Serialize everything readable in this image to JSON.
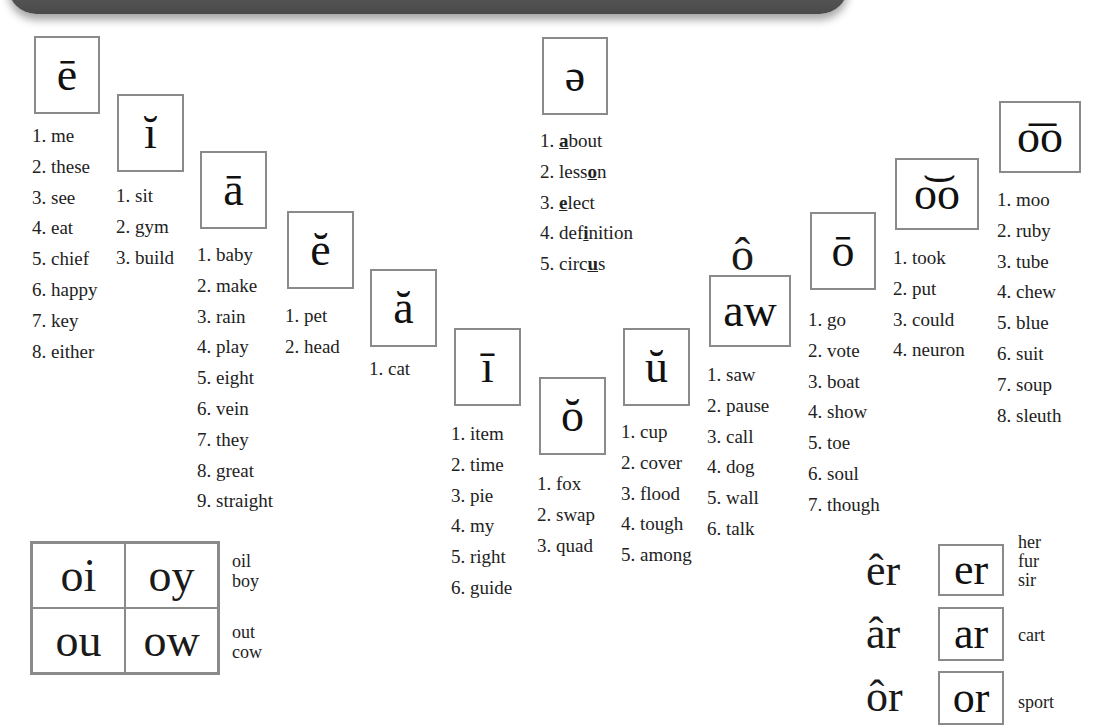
{
  "banner": {
    "visible": true,
    "color": "#555555"
  },
  "vowels": [
    {
      "id": "e-long",
      "symbol": "ē",
      "words": [
        "1. me",
        "2. these",
        "3. see",
        "4. eat",
        "5. chief",
        "6. happy",
        "7. key",
        "8. either"
      ]
    },
    {
      "id": "i-short",
      "symbol": "ĭ",
      "words": [
        "1. sit",
        "2. gym",
        "3. build"
      ]
    },
    {
      "id": "a-long",
      "symbol": "ā",
      "words": [
        "1. baby",
        "2. make",
        "3. rain",
        "4. play",
        "5. eight",
        "6. vein",
        "7. they",
        "8. great",
        "9. straight"
      ]
    },
    {
      "id": "e-short",
      "symbol": "ĕ",
      "words": [
        "1. pet",
        "2. head"
      ]
    },
    {
      "id": "a-short",
      "symbol": "ă",
      "words": [
        "1. cat"
      ]
    },
    {
      "id": "schwa",
      "symbol": "ə",
      "words": [
        {
          "pre": "1. ",
          "u": "a",
          "post": "bout"
        },
        {
          "pre": "2. less",
          "u": "o",
          "post": "n"
        },
        {
          "pre": "3. ",
          "u": "e",
          "post": "lect"
        },
        {
          "pre": "4. def",
          "u": "i",
          "post": "nition"
        },
        {
          "pre": "5. circ",
          "u": "u",
          "post": "s"
        }
      ]
    },
    {
      "id": "i-long",
      "symbol": "ī",
      "words": [
        "1. item",
        "2. time",
        "3. pie",
        "4. my",
        "5. right",
        "6. guide"
      ]
    },
    {
      "id": "o-short",
      "symbol": "ŏ",
      "words": [
        "1. fox",
        "2. swap",
        "3. quad"
      ]
    },
    {
      "id": "u-short",
      "symbol": "ŭ",
      "words": [
        "1. cup",
        "2. cover",
        "3. flood",
        "4. tough",
        "5. among"
      ]
    },
    {
      "id": "aw",
      "above": "ô",
      "symbol": "aw",
      "words": [
        "1. saw",
        "2. pause",
        "3. call",
        "4. dog",
        "5. wall",
        "6. talk"
      ]
    },
    {
      "id": "o-long",
      "symbol": "ō",
      "words": [
        "1. go",
        "2. vote",
        "3. boat",
        "4. show",
        "5. toe",
        "6. soul",
        "7. though"
      ]
    },
    {
      "id": "oo-short",
      "symbol": "o͝o",
      "words": [
        "1. took",
        "2. put",
        "3. could",
        "4. neuron"
      ]
    },
    {
      "id": "oo-long",
      "symbol": "o͞o",
      "words": [
        "1. moo",
        "2. ruby",
        "3. tube",
        "4. chew",
        "5. blue",
        "6. suit",
        "7. soup",
        "8. sleuth"
      ]
    }
  ],
  "diphthongs": {
    "cells": [
      "oi",
      "oy",
      "ou",
      "ow"
    ],
    "examples": [
      [
        "oil",
        "boy"
      ],
      [
        "out",
        "cow"
      ]
    ]
  },
  "r_controlled": [
    {
      "label": "êr",
      "symbol": "er",
      "examples": [
        "her",
        "fur",
        "sir"
      ]
    },
    {
      "label": "âr",
      "symbol": "ar",
      "examples": [
        "cart"
      ]
    },
    {
      "label": "ôr",
      "symbol": "or",
      "examples": [
        "sport"
      ]
    }
  ]
}
